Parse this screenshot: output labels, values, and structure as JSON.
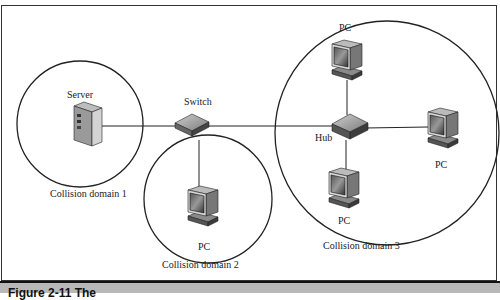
{
  "diagram": {
    "nodes": {
      "server": {
        "label": "Server",
        "icon": "server-icon"
      },
      "switch": {
        "label": "Switch",
        "icon": "switch-icon"
      },
      "hub": {
        "label": "Hub",
        "icon": "hub-icon"
      },
      "pc_domain2": {
        "label": "PC",
        "icon": "pc-icon"
      },
      "pc_top": {
        "label": "PC",
        "icon": "pc-icon"
      },
      "pc_right": {
        "label": "PC",
        "icon": "pc-icon"
      },
      "pc_bottom": {
        "label": "PC",
        "icon": "pc-icon"
      }
    },
    "domains": [
      {
        "label": "Collision domain 1"
      },
      {
        "label": "Collision domain 2"
      },
      {
        "label": "Collision domain 3"
      }
    ],
    "edges": [
      {
        "from": "server",
        "to": "switch"
      },
      {
        "from": "switch",
        "to": "pc_domain2"
      },
      {
        "from": "switch",
        "to": "hub"
      },
      {
        "from": "hub",
        "to": "pc_top"
      },
      {
        "from": "hub",
        "to": "pc_right"
      },
      {
        "from": "hub",
        "to": "pc_bottom"
      }
    ]
  },
  "caption": {
    "text": "Figure 2-11    The"
  }
}
